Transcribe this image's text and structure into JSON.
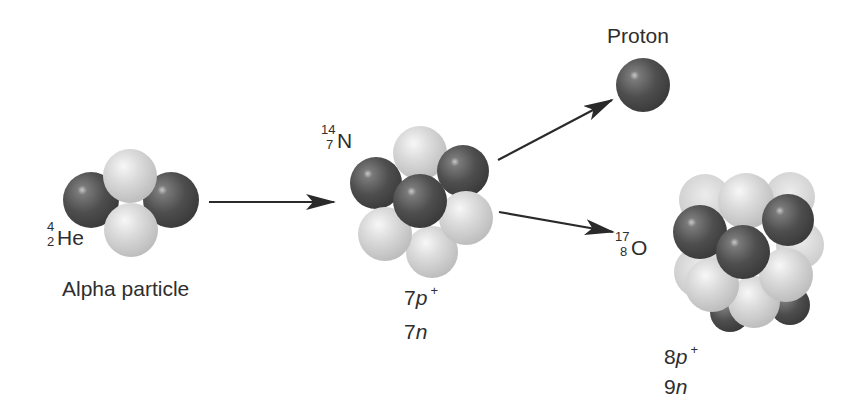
{
  "diagram": {
    "colors": {
      "proton": "#4a4a4a",
      "neutron": "#d2d2d2",
      "text": "#2e2e2e",
      "arrow": "#2a2a2a",
      "background": "#ffffff"
    },
    "reactant_alpha": {
      "symbol": "He",
      "mass_number": "4",
      "atomic_number": "2",
      "caption": "Alpha particle"
    },
    "reactant_target": {
      "symbol": "N",
      "mass_number": "14",
      "atomic_number": "7",
      "protons_count": "7",
      "protons_unit": "p",
      "protons_charge": "+",
      "neutrons_count": "7",
      "neutrons_unit": "n"
    },
    "product_proton": {
      "label": "Proton"
    },
    "product_oxygen": {
      "symbol": "O",
      "mass_number": "17",
      "atomic_number": "8",
      "protons_count": "8",
      "protons_unit": "p",
      "protons_charge": "+",
      "neutrons_count": "9",
      "neutrons_unit": "n"
    },
    "arrows": [
      {
        "name": "alpha-to-nitrogen",
        "from": "Alpha particle",
        "to": "14N"
      },
      {
        "name": "nitrogen-to-proton",
        "from": "14N",
        "to": "Proton"
      },
      {
        "name": "nitrogen-to-oxygen",
        "from": "14N",
        "to": "17O"
      }
    ]
  }
}
